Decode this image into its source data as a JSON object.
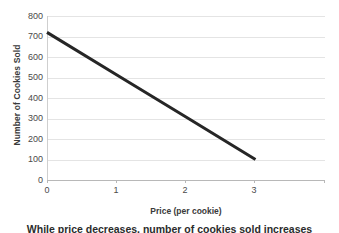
{
  "chart_data": {
    "type": "line",
    "title": "",
    "xlabel": "Price (per cookie)",
    "ylabel": "Number of Cookies Sold",
    "xlim": [
      0,
      4
    ],
    "ylim": [
      0,
      800
    ],
    "x_ticks": [
      "0",
      "1",
      "2",
      "3"
    ],
    "x_tick_values": [
      0,
      1,
      2,
      3
    ],
    "y_ticks": [
      "0",
      "100",
      "200",
      "300",
      "400",
      "500",
      "600",
      "700",
      "800"
    ],
    "y_tick_values": [
      0,
      100,
      200,
      300,
      400,
      500,
      600,
      700,
      800
    ],
    "grid": "horizontal",
    "legend": "none",
    "series": [
      {
        "name": "Demand",
        "color": "#262626",
        "line_width": 3,
        "x": [
          0,
          3
        ],
        "values": [
          720,
          100
        ],
        "points": [
          {
            "x": 0,
            "y": 720
          },
          {
            "x": 1,
            "y": 513
          },
          {
            "x": 2,
            "y": 307
          },
          {
            "x": 3,
            "y": 100
          }
        ]
      }
    ]
  },
  "caption": {
    "clipped_text": "While price decreases, number of cookies sold increases"
  },
  "colors": {
    "line": "#262626",
    "gridline": "#e4e4e4",
    "axis": "#b8b8b8",
    "tick_text": "#4a4a4a",
    "axis_title": "#3a3a3a",
    "background": "#ffffff"
  }
}
